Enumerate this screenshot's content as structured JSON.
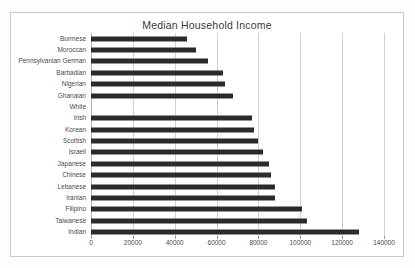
{
  "chart_data": {
    "type": "bar",
    "orientation": "horizontal",
    "title": "Median Household Income",
    "xlabel": "",
    "ylabel": "",
    "xlim": [
      0,
      140000
    ],
    "xticks": [
      0,
      20000,
      40000,
      60000,
      80000,
      100000,
      120000,
      140000
    ],
    "xtick_labels": [
      "0",
      "20000",
      "40000",
      "60000",
      "80000",
      "100000",
      "120000",
      "140000"
    ],
    "grid": true,
    "legend": false,
    "bar_color": "#2b2b2b",
    "categories": [
      "Burmese",
      "Moroccan",
      "Pennsylvanian German",
      "Barbadian",
      "Nigerian",
      "Ghanaian",
      "White",
      "Irish",
      "Korean",
      "Scottish",
      "Israeli",
      "Japanese",
      "Chinese",
      "Lebanese",
      "Iranian",
      "Filipino",
      "Taiwanese",
      "Indian"
    ],
    "values": [
      46000,
      50000,
      56000,
      63000,
      64000,
      68000,
      0,
      77000,
      78000,
      80000,
      82000,
      85000,
      86000,
      88000,
      88000,
      101000,
      103000,
      128000
    ]
  }
}
